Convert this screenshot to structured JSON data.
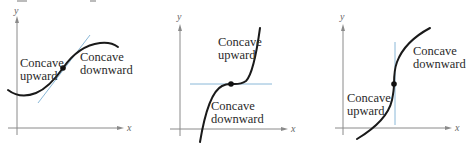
{
  "figure": {
    "panels": [
      {
        "id": "panel-1",
        "axes": {
          "x_label": "x",
          "y_label": "y"
        },
        "tangent": "slanted",
        "labels": [
          {
            "line1": "Concave",
            "line2": "upward"
          },
          {
            "line1": "Concave",
            "line2": "downward"
          }
        ]
      },
      {
        "id": "panel-2",
        "axes": {
          "x_label": "x",
          "y_label": "y"
        },
        "tangent": "horizontal",
        "labels": [
          {
            "line1": "Concave",
            "line2": "upward"
          },
          {
            "line1": "Concave",
            "line2": "downward"
          }
        ]
      },
      {
        "id": "panel-3",
        "axes": {
          "x_label": "x",
          "y_label": "y"
        },
        "tangent": "vertical",
        "labels": [
          {
            "line1": "Concave",
            "line2": "downward"
          },
          {
            "line1": "Concave",
            "line2": "upward"
          }
        ]
      }
    ],
    "colors": {
      "curve": "#1a1a1a",
      "tangent": "#8ab8d8",
      "axis": "#8a8a8a"
    }
  }
}
